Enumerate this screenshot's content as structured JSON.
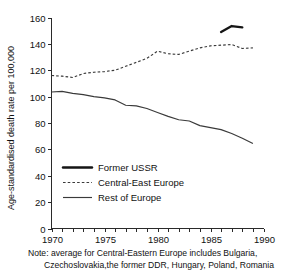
{
  "chart_data": {
    "type": "line",
    "title": "",
    "xlabel": "",
    "ylabel": "Age-standardised death rate per 100,000",
    "xlim": [
      1970,
      1990
    ],
    "ylim": [
      0,
      160
    ],
    "xticks": [
      1970,
      1971,
      1972,
      1973,
      1974,
      1975,
      1976,
      1977,
      1978,
      1979,
      1980,
      1981,
      1982,
      1983,
      1984,
      1985,
      1986,
      1987,
      1988,
      1989,
      1990
    ],
    "xtick_labels": [
      "1970",
      "",
      "",
      "",
      "",
      "1975",
      "",
      "",
      "",
      "",
      "1980",
      "",
      "",
      "",
      "",
      "1985",
      "",
      "",
      "",
      "",
      "1990"
    ],
    "yticks": [
      0,
      20,
      40,
      60,
      80,
      100,
      120,
      140,
      160
    ],
    "ytick_labels": [
      "0",
      "20",
      "40",
      "60",
      "80",
      "100",
      "120",
      "140",
      "160"
    ],
    "grid": false,
    "legend_position": "center-left",
    "series": [
      {
        "name": "Former USSR",
        "style": "solid-thick",
        "color": "#151515",
        "x": [
          1986,
          1987,
          1988
        ],
        "values": [
          149,
          153.5,
          152.5
        ]
      },
      {
        "name": "Central-East Europe",
        "style": "dashed",
        "color": "#3a3a3a",
        "x": [
          1970,
          1971,
          1972,
          1973,
          1974,
          1975,
          1976,
          1977,
          1978,
          1979,
          1980,
          1981,
          1982,
          1983,
          1984,
          1985,
          1986,
          1987,
          1988,
          1989
        ],
        "values": [
          116,
          115.5,
          114.5,
          117.5,
          118.5,
          119,
          120,
          123,
          126,
          129,
          134.5,
          132.5,
          132,
          134.5,
          137,
          138.5,
          139,
          139.5,
          136.5,
          137
        ]
      },
      {
        "name": "Rest of Europe",
        "style": "solid",
        "color": "#3a3a3a",
        "x": [
          1970,
          1971,
          1972,
          1973,
          1974,
          1975,
          1976,
          1977,
          1978,
          1979,
          1980,
          1981,
          1982,
          1983,
          1984,
          1985,
          1986,
          1987,
          1988,
          1989
        ],
        "values": [
          103.5,
          104,
          102.5,
          101.5,
          100,
          99,
          97.5,
          93.5,
          93,
          91,
          88,
          85,
          82.5,
          81.5,
          78,
          76.5,
          75,
          72,
          68.5,
          64.5
        ]
      }
    ]
  },
  "legend": {
    "items": [
      {
        "label": "Former USSR",
        "style": "solid-thick"
      },
      {
        "label": "Central-East Europe",
        "style": "dashed"
      },
      {
        "label": "Rest of Europe",
        "style": "solid"
      }
    ]
  },
  "axes": {
    "ylabel": "Age-standardised death rate per 100,000"
  },
  "note": {
    "line1": "Note: average for Central-Eastern Europe includes Bulgaria,",
    "line2": "Czechoslovakia,the former DDR, Hungary, Poland, Romania"
  },
  "colors": {
    "axis": "#2a2a2a",
    "ink": "#111111",
    "series_thick": "#151515",
    "series_thin": "#3a3a3a",
    "background": "#ffffff"
  }
}
